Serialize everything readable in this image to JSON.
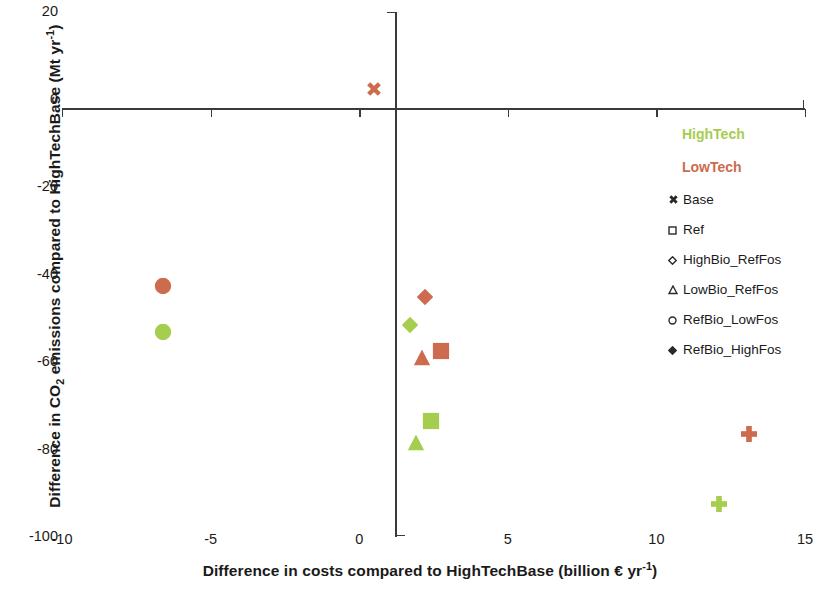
{
  "chart_data": {
    "type": "scatter",
    "title": "",
    "xlabel": "Difference in costs compared to HighTechBase (billion € yr⁻¹)",
    "ylabel": "Difference in CO₂ emissions compared to HighTechBase (Mt yr⁻¹)",
    "xlim": [
      -10,
      15
    ],
    "ylim": [
      -100,
      20
    ],
    "xticks": [
      -10,
      -5,
      0,
      5,
      10,
      15
    ],
    "yticks": [
      20,
      0,
      -20,
      -40,
      -60,
      -80,
      -100
    ],
    "xtick_labels": [
      "-10",
      "-5",
      "0",
      "5",
      "10",
      "15"
    ],
    "ytick_labels": [
      "20",
      "0",
      "-20",
      "-40",
      "-60",
      "-80",
      "-100"
    ],
    "grid": false,
    "legend_position": "right",
    "axes_style": "crossed-at-origin",
    "series": [
      {
        "name": "HighTech",
        "color": "#a5cd4e",
        "points": [
          {
            "scenario": "Ref",
            "marker": "square",
            "x": 2.4,
            "y": -74.0
          },
          {
            "scenario": "HighBio_RefFos",
            "marker": "diamond",
            "x": 1.7,
            "y": -52.0
          },
          {
            "scenario": "LowBio_RefFos",
            "marker": "triangle",
            "x": 1.9,
            "y": -79.0
          },
          {
            "scenario": "RefBio_LowFos",
            "marker": "circle",
            "x": -6.6,
            "y": -53.5
          },
          {
            "scenario": "RefBio_HighFos",
            "marker": "plus",
            "x": 12.1,
            "y": -93.0
          }
        ]
      },
      {
        "name": "LowTech",
        "color": "#cd6b4f",
        "points": [
          {
            "scenario": "Base",
            "marker": "cross",
            "x": 0.5,
            "y": 2.0
          },
          {
            "scenario": "Ref",
            "marker": "square",
            "x": 2.75,
            "y": -58.0
          },
          {
            "scenario": "HighBio_RefFos",
            "marker": "diamond",
            "x": 2.2,
            "y": -45.5
          },
          {
            "scenario": "LowBio_RefFos",
            "marker": "triangle",
            "x": 2.1,
            "y": -59.5
          },
          {
            "scenario": "RefBio_LowFos",
            "marker": "circle",
            "x": -6.6,
            "y": -43.0
          },
          {
            "scenario": "RefBio_HighFos",
            "marker": "plus",
            "x": 13.1,
            "y": -77.0
          }
        ]
      }
    ]
  },
  "legend": {
    "series_labels": [
      {
        "label": "HighTech",
        "color": "#a5cd4e"
      },
      {
        "label": "LowTech",
        "color": "#cd6b4f"
      }
    ],
    "marker_entries": [
      {
        "label": "Base",
        "glyph": "cross"
      },
      {
        "label": "Ref",
        "glyph": "square"
      },
      {
        "label": "HighBio_RefFos",
        "glyph": "diamond"
      },
      {
        "label": "LowBio_RefFos",
        "glyph": "triangle"
      },
      {
        "label": "RefBio_LowFos",
        "glyph": "circle"
      },
      {
        "label": "RefBio_HighFos",
        "glyph": "diamond-filled"
      }
    ]
  },
  "axes": {
    "y_label_parts": {
      "pre": "Difference in CO",
      "sub": "2",
      "post": " emissions compared to HighTechBase (Mt yr",
      "sup": "-1",
      "end": ")"
    },
    "x_label_parts": {
      "pre": "Difference in costs compared to HighTechBase (billion € yr",
      "sup": "-1",
      "end": ")"
    }
  }
}
